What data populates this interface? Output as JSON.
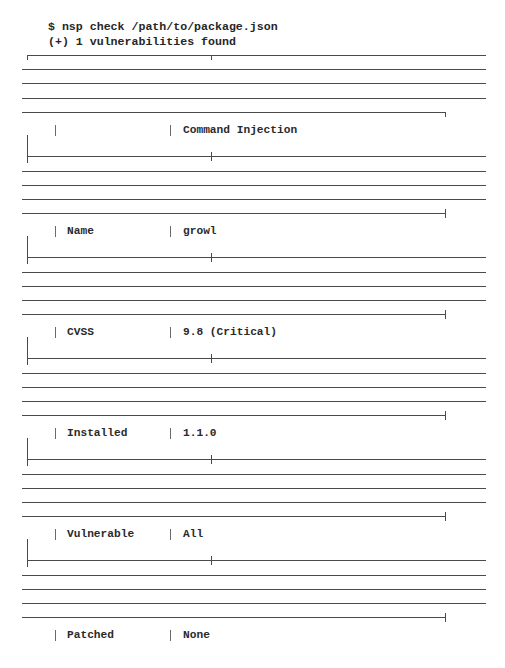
{
  "terminal": {
    "command": "$ nsp check /path/to/package.json",
    "summary": "(+) 1 vulnerabilities found"
  },
  "table": {
    "title_row": {
      "label": "",
      "value": "Command Injection"
    },
    "rows": [
      {
        "label": "Name",
        "value": "growl"
      },
      {
        "label": "CVSS",
        "value": "9.8 (Critical)"
      },
      {
        "label": "Installed",
        "value": "1.1.0"
      },
      {
        "label": "Vulnerable",
        "value": "All"
      },
      {
        "label": "Patched",
        "value": "None"
      }
    ]
  },
  "colors": {
    "line": "#4a4a4a",
    "text": "#2a2a2a",
    "background": "#ffffff"
  }
}
